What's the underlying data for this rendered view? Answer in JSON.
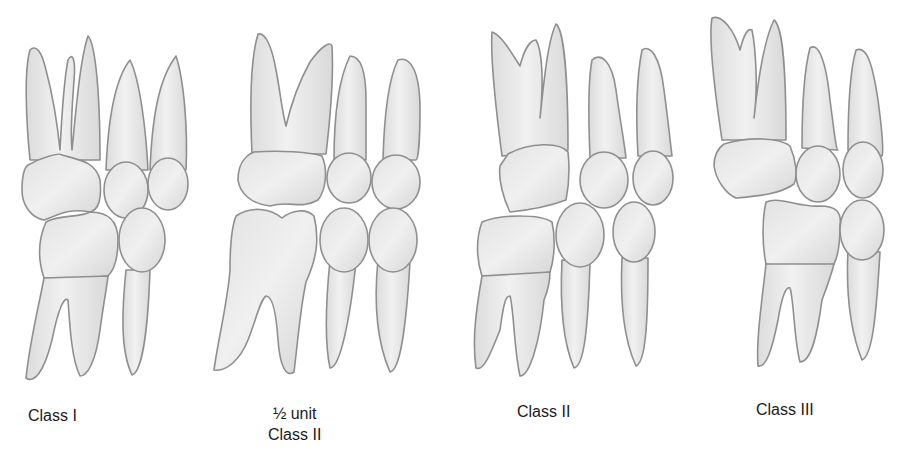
{
  "figure": {
    "panels": [
      {
        "id": "class-1",
        "label_line1": "Class I",
        "label_line2": ""
      },
      {
        "id": "half-unit-class-2",
        "label_line1": "½ unit",
        "label_line2": "Class II"
      },
      {
        "id": "class-2",
        "label_line1": "Class II",
        "label_line2": ""
      },
      {
        "id": "class-3",
        "label_line1": "Class III",
        "label_line2": ""
      }
    ],
    "colors": {
      "tooth_fill": "#e9e9e9",
      "tooth_outline": "#8f8f8f",
      "text": "#1a1a1a",
      "background": "#ffffff"
    }
  }
}
